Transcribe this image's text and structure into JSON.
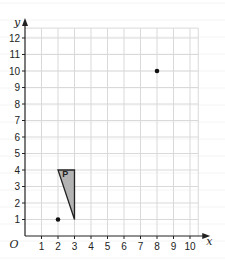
{
  "chart_data": {
    "type": "scatter",
    "title": "",
    "xlabel": "x",
    "ylabel": "y",
    "origin_label": "O",
    "xlim": [
      0,
      10.5
    ],
    "ylim": [
      0,
      12.6
    ],
    "grid": true,
    "x_ticks": [
      1,
      2,
      3,
      4,
      5,
      6,
      7,
      8,
      9,
      10
    ],
    "y_ticks": [
      1,
      2,
      3,
      4,
      5,
      6,
      7,
      8,
      9,
      10,
      11,
      12
    ],
    "points": [
      {
        "x": 2,
        "y": 1
      },
      {
        "x": 8,
        "y": 10
      }
    ],
    "polygons": [
      {
        "label": "P",
        "vertices": [
          [
            2,
            4
          ],
          [
            3,
            4
          ],
          [
            3,
            1
          ]
        ],
        "fill": "#b3b3b3"
      }
    ]
  },
  "colors": {
    "grid": "#d9d9d9",
    "axis": "#222222",
    "point": "#111111",
    "shape_fill": "#b3b3b3"
  }
}
